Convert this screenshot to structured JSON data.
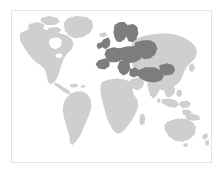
{
  "figure": {
    "type": "choropleth-world-map",
    "background_color": "#ffffff",
    "frame": {
      "border_color": "#e3e3e3",
      "fill_color": "#ffffff"
    }
  },
  "colors": {
    "ocean": "#ffffff",
    "land_default": "#cfcfcf",
    "land_highlight": "#7d7d7d",
    "frame_border": "#e3e3e3"
  },
  "legend": {
    "visible": false,
    "entries": [
      {
        "label": "Highlighted",
        "color": "#7d7d7d"
      },
      {
        "label": "Other",
        "color": "#cfcfcf"
      }
    ]
  },
  "regions": {
    "highlighted": [
      "Scandinavia",
      "British Isles",
      "Western Europe",
      "Central Europe",
      "Southern Europe",
      "Eastern Europe",
      "Turkey",
      "Caucasus"
    ],
    "default": [
      "North America",
      "Greenland",
      "South America",
      "Africa",
      "Asia",
      "Australia",
      "New Zealand"
    ]
  },
  "projection": {
    "name": "equirectangular",
    "lon_range": [
      -180,
      180
    ],
    "lat_range": [
      -60,
      84
    ]
  }
}
